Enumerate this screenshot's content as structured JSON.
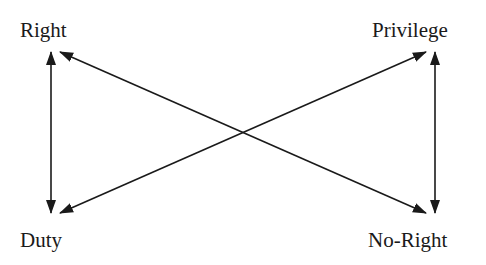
{
  "nodes": {
    "top_left": "Right",
    "top_right": "Privilege",
    "bottom_left": "Duty",
    "bottom_right": "No-Right"
  },
  "edges": [
    {
      "from": "Right",
      "to": "Duty",
      "type": "bidirectional",
      "orientation": "vertical"
    },
    {
      "from": "Privilege",
      "to": "No-Right",
      "type": "bidirectional",
      "orientation": "vertical"
    },
    {
      "from": "Right",
      "to": "No-Right",
      "type": "bidirectional",
      "orientation": "diagonal"
    },
    {
      "from": "Duty",
      "to": "Privilege",
      "type": "bidirectional",
      "orientation": "diagonal"
    }
  ],
  "colors": {
    "line": "#1a1a1a",
    "background": "#ffffff"
  }
}
